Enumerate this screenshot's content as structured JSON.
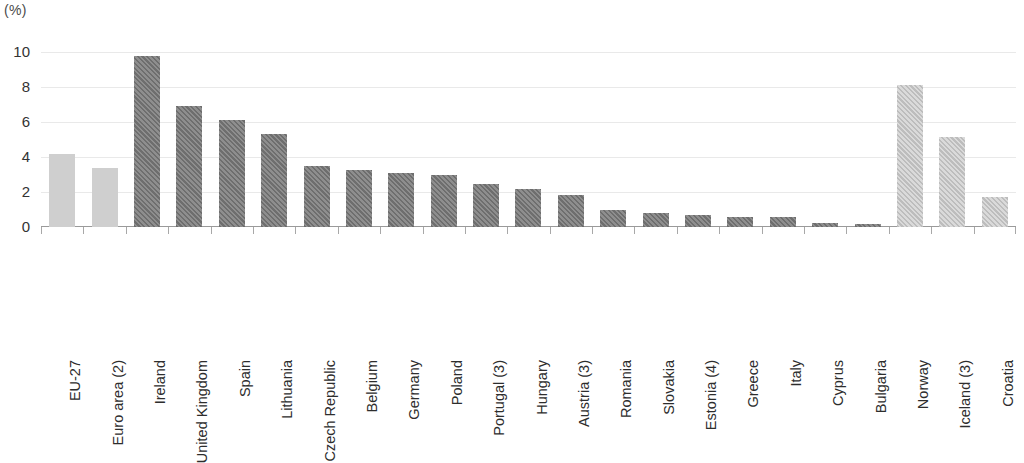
{
  "unit_label": "(%)",
  "chart_data": {
    "type": "bar",
    "title": "",
    "subtitle": "",
    "xlabel": "",
    "ylabel": "",
    "unit": "(%)",
    "ylim": [
      0,
      10
    ],
    "yticks": [
      0,
      2,
      4,
      6,
      8,
      10
    ],
    "grid": true,
    "legend": "none",
    "categories": [
      "EU-27",
      "Euro area (2)",
      "Ireland",
      "United Kingdom",
      "Spain",
      "Lithuania",
      "Czech Republic",
      "Belgium",
      "Germany",
      "Poland",
      "Portugal (3)",
      "Hungary",
      "Austria (3)",
      "Romania",
      "Slovakia",
      "Estonia (4)",
      "Greece",
      "Italy",
      "Cyprus",
      "Bulgaria",
      "Norway",
      "Iceland (3)",
      "Croatia"
    ],
    "values": [
      4.2,
      3.35,
      9.75,
      6.9,
      6.1,
      5.3,
      3.5,
      3.25,
      3.1,
      3.0,
      2.45,
      2.15,
      1.85,
      0.95,
      0.8,
      0.7,
      0.6,
      0.55,
      0.25,
      0.15,
      8.1,
      5.15,
      1.7
    ],
    "styles": [
      "solid-light",
      "solid-light",
      "hatch-dark",
      "hatch-dark",
      "hatch-dark",
      "hatch-dark",
      "hatch-dark",
      "hatch-dark",
      "hatch-dark",
      "hatch-dark",
      "hatch-dark",
      "hatch-dark",
      "hatch-dark",
      "hatch-dark",
      "hatch-dark",
      "hatch-dark",
      "hatch-dark",
      "hatch-dark",
      "hatch-dark",
      "hatch-dark",
      "hatch-light",
      "hatch-light",
      "hatch-light"
    ]
  },
  "colors": {
    "aggregate_bar": "#cfcfcf",
    "member_bar": "#7d7d7d",
    "nonmember_bar": "#c8c8c8",
    "gridline": "#e9e9e9",
    "axis": "#9a9a9a",
    "text": "#2d2d2d"
  }
}
